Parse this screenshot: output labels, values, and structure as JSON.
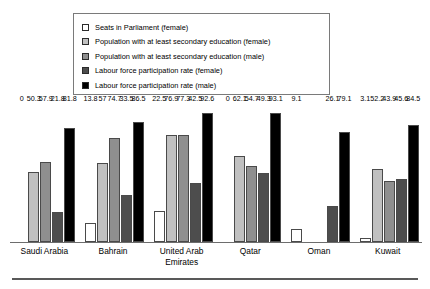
{
  "chart_data": {
    "type": "bar",
    "title": "",
    "subtitle": "",
    "xlabel": "",
    "ylabel": "",
    "ylim": [
      0,
      100
    ],
    "grid": false,
    "legend_position": "top",
    "categories": [
      "Saudi Arabia",
      "Bahrain",
      "United Arab Emirates",
      "Qatar",
      "Oman",
      "Kuwait"
    ],
    "category_lines": [
      [
        "Saudi Arabia"
      ],
      [
        "Bahrain"
      ],
      [
        "United Arab",
        "Emirates"
      ],
      [
        "Qatar"
      ],
      [
        "Oman"
      ],
      [
        "Kuwait"
      ]
    ],
    "series": [
      {
        "name": "Seats in Parliament (female)",
        "color": "#ffffff",
        "values": [
          0,
          13.8,
          22.5,
          0,
          9.1,
          3.1
        ],
        "labels": [
          "0",
          "13.8",
          "22.5",
          "0",
          "9.1",
          "3.1"
        ]
      },
      {
        "name": "Population with at least secondary education (female)",
        "color": "#c0c0c0",
        "values": [
          50.3,
          57,
          76.9,
          62.1,
          null,
          52.2
        ],
        "labels": [
          "50.3",
          "57",
          "76.9",
          "62.1",
          "",
          "52.2"
        ]
      },
      {
        "name": "Population with at least secondary education (male)",
        "color": "#8f8f8f",
        "values": [
          57.9,
          74.7,
          77.3,
          54.7,
          null,
          43.9
        ],
        "labels": [
          "57.9",
          "74.7",
          "77.3",
          "54.7",
          "",
          "43.9"
        ]
      },
      {
        "name": "Labour force participation rate (female)",
        "color": "#4d4d4d",
        "values": [
          21.8,
          33.5,
          42.5,
          49.3,
          26.1,
          45.6
        ],
        "labels": [
          "21.8",
          "33.5",
          "42.5",
          "49.3",
          "26.1",
          "45.6"
        ]
      },
      {
        "name": "Labour force participation rate (male)",
        "color": "#000000",
        "values": [
          81.8,
          86.5,
          92.6,
          93.1,
          79.1,
          84.5
        ],
        "labels": [
          "81.8",
          "86.5",
          "92.6",
          "93.1",
          "79.1",
          "84.5"
        ]
      }
    ]
  },
  "legend": {
    "items": [
      {
        "label": "Seats in Parliament (female)",
        "color": "#ffffff"
      },
      {
        "label": "Population with at least secondary education (female)",
        "color": "#c0c0c0"
      },
      {
        "label": "Population with at least secondary education (male)",
        "color": "#8f8f8f"
      },
      {
        "label": "Labour force participation rate (female)",
        "color": "#4d4d4d"
      },
      {
        "label": "Labour force participation rate (male)",
        "color": "#000000"
      }
    ]
  }
}
